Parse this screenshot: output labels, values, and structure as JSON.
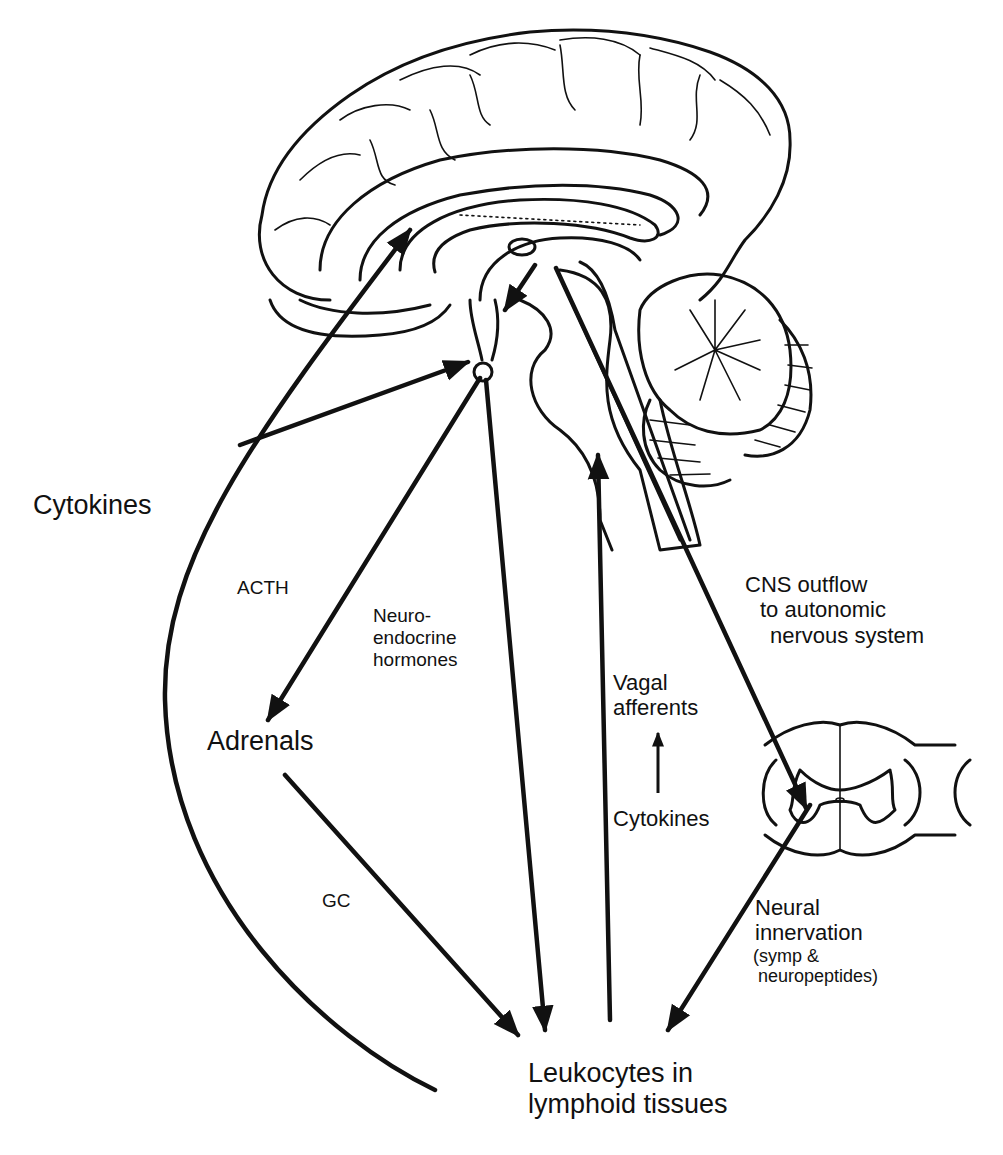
{
  "diagram": {
    "labels": {
      "cytokines_left": "Cytokines",
      "acth": "ACTH",
      "neuroendocrine": [
        "Neuro-",
        "endocrine",
        "hormones"
      ],
      "cns_outflow": [
        "CNS outflow",
        "to autonomic",
        "nervous system"
      ],
      "vagal": [
        "Vagal",
        "afferents"
      ],
      "cytokines_small": "Cytokines",
      "adrenals": "Adrenals",
      "gc": "GC",
      "neural_innervation": [
        "Neural",
        "innervation",
        "(symp &",
        " neuropeptides)"
      ],
      "leukocytes": [
        "Leukocytes in",
        "lymphoid tissues"
      ]
    },
    "structures": [
      "brain-sagittal-section",
      "hypothalamus",
      "pituitary",
      "brainstem",
      "cerebellum",
      "spinal-cord-cross-section"
    ],
    "arrows": [
      {
        "from": "cytokines",
        "to": "brain-cortex",
        "name": "cytokine-to-brain-arrow"
      },
      {
        "from": "cytokines",
        "to": "hypothalamus",
        "name": "cytokine-to-hypothalamus-arrow"
      },
      {
        "from": "pituitary",
        "to": "adrenals",
        "label": "ACTH"
      },
      {
        "from": "pituitary",
        "to": "leukocytes",
        "label": "Neuroendocrine hormones"
      },
      {
        "from": "leukocytes",
        "to": "brainstem",
        "label": "Vagal afferents"
      },
      {
        "from": "brainstem",
        "to": "spinal-cord",
        "label": "CNS outflow to autonomic nervous system"
      },
      {
        "from": "adrenals",
        "to": "leukocytes",
        "label": "GC"
      },
      {
        "from": "spinal-cord",
        "to": "leukocytes",
        "label": "Neural innervation (symp & neuropeptides)"
      },
      {
        "from": "cytokines-small",
        "to": "vagal-afferents"
      }
    ],
    "colors": {
      "line": "#111111",
      "background": "#ffffff"
    }
  }
}
